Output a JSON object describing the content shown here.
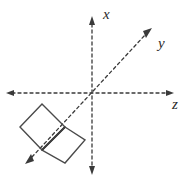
{
  "figure": {
    "width": 191,
    "height": 181,
    "background_color": "#ffffff",
    "axis_color": "#3a3a3a",
    "shape_color": "#4a4a4a",
    "label_color": "#2b2b2b"
  },
  "axes": {
    "origin": {
      "x": 92,
      "y": 93
    },
    "items": [
      {
        "name": "x",
        "label": "x",
        "orientation": "vertical",
        "label_x": 104,
        "label_y": 19,
        "start": {
          "x": 92,
          "y": 172
        },
        "end": {
          "x": 92,
          "y": 18
        },
        "arrow_start": true,
        "arrow_end": true
      },
      {
        "name": "y",
        "label": "y",
        "orientation": "diagonal-up-right",
        "label_x": 158,
        "label_y": 48,
        "start": {
          "x": 27,
          "y": 162
        },
        "end": {
          "x": 150,
          "y": 30
        },
        "arrow_start": true,
        "arrow_end": true
      },
      {
        "name": "z",
        "label": "z",
        "orientation": "horizontal",
        "label_x": 172,
        "label_y": 109,
        "start": {
          "x": 8,
          "y": 93
        },
        "end": {
          "x": 172,
          "y": 93
        },
        "arrow_start": true,
        "arrow_end": true
      }
    ]
  },
  "shapes": {
    "squares": [
      {
        "name": "square-upper-left",
        "points": "42,104 65,127 42,150 20,127"
      },
      {
        "name": "square-lower-right",
        "points": "65,127 85,140 65,163 42,150"
      }
    ],
    "shared_edge": {
      "name": "shared-edge",
      "from": {
        "x": 65,
        "y": 127
      },
      "to": {
        "x": 42,
        "y": 150
      }
    }
  }
}
